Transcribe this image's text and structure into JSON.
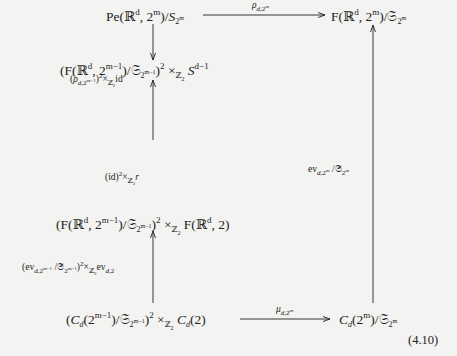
{
  "diagram": {
    "type": "commutative-diagram",
    "nodes": {
      "top_left": "Pe(ℝᵈ, 2ᵐ)/𝒮₂ᵐ",
      "top_right": "F(ℝᵈ, 2ᵐ)/𝔖₂ᵐ",
      "row2_left": "(F(ℝᵈ, 2ᵐ⁻¹)/𝔖₂ᵐ⁻¹)² ×ℤ₂ Sᵈ⁻¹",
      "row3_left": "(F(ℝᵈ, 2ᵐ⁻¹)/𝔖₂ᵐ⁻¹)² ×ℤ₂ F(ℝᵈ, 2)",
      "bottom_left": "(C_d(2ᵐ⁻¹)/𝔖₂ᵐ⁻¹)² ×ℤ₂ C_d(2)",
      "bottom_right": "C_d(2ᵐ)/𝔖₂ᵐ"
    },
    "arrows": {
      "top": "ρ_{d,2^m}",
      "left_1": "(ρ_{d,2^{m-1}})² ×ℤ₂ id",
      "left_2": "(id)² ×ℤ₂ r",
      "left_3": "(ev_{d,2^{m-1}} /𝔖_{2^{m-1}})² ×ℤ₂ ev_{d,2}",
      "right": "ev_{d,2^m} /𝔖_{2^m}",
      "bottom": "μ_{d,2^m}"
    },
    "equation_number": "(4.10)"
  }
}
